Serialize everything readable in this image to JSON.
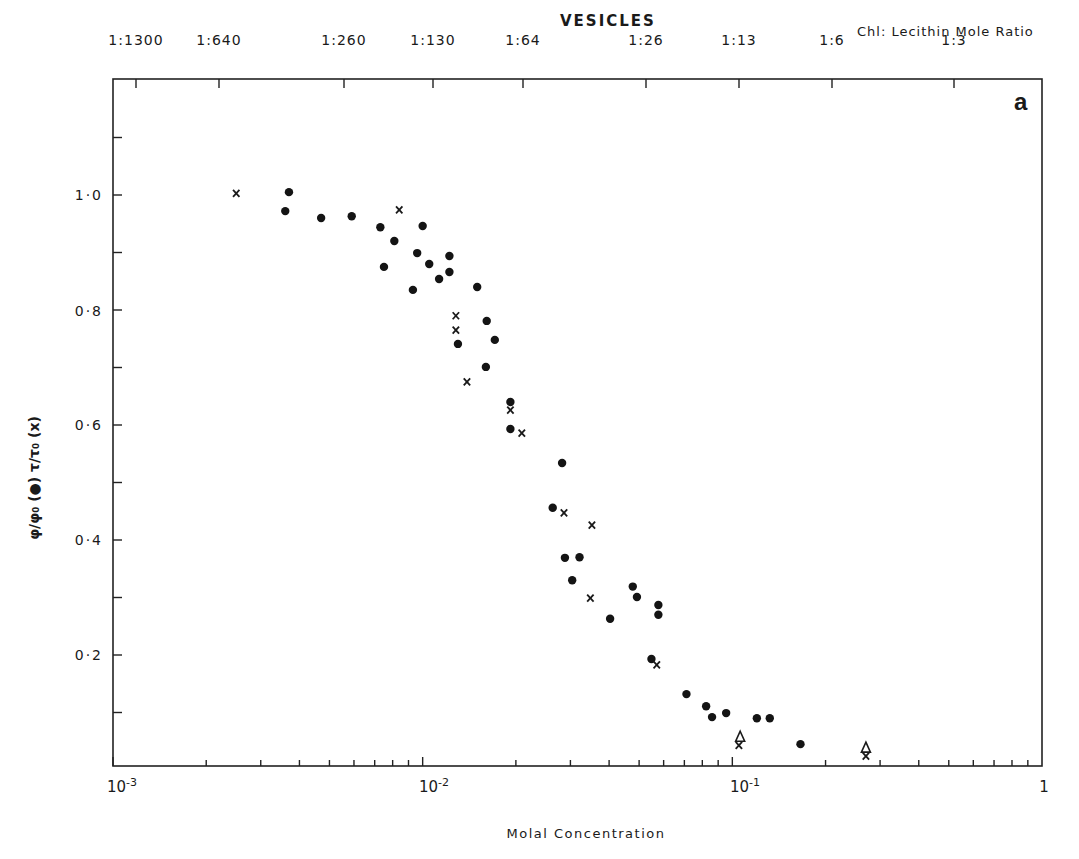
{
  "header": {
    "title": "VESICLES",
    "top_axis_label": "Chl: Lecithin Mole Ratio",
    "panel_letter": "a"
  },
  "axes": {
    "xlabel": "Molal Concentration",
    "ylabel": "φ/φ₀ (●)  τ/τ₀ (x)",
    "x_ticks": [
      {
        "label": "10",
        "exp": "-3"
      },
      {
        "label": "10",
        "exp": "-2"
      },
      {
        "label": "10",
        "exp": "-1"
      },
      {
        "label": "1",
        "exp": ""
      }
    ],
    "y_ticks": [
      "1·0",
      "0·8",
      "0·6",
      "0·4",
      "0·2"
    ],
    "top_ticks": [
      "1:1300",
      "1:640",
      "1:260",
      "1:130",
      "1:64",
      "1:26",
      "1:13",
      "1:6",
      "1:3"
    ]
  },
  "chart_data": {
    "type": "scatter",
    "title": "VESICLES",
    "xlabel": "Molal Concentration",
    "ylabel": "φ/φ₀ (●)  τ/τ₀ (x)",
    "xscale": "log",
    "xlim": [
      0.001,
      1
    ],
    "ylim": [
      0,
      1.2
    ],
    "grid": false,
    "secondary_x_axis": {
      "label": "Chl: Lecithin Mole Ratio",
      "ticks": [
        "1:1300",
        "1:640",
        "1:260",
        "1:130",
        "1:64",
        "1:26",
        "1:13",
        "1:6",
        "1:3"
      ]
    },
    "series": [
      {
        "name": "φ/φ₀ (filled circles)",
        "marker": "circle",
        "points": [
          [
            0.0037,
            1.005
          ],
          [
            0.0036,
            0.972
          ],
          [
            0.0047,
            0.96
          ],
          [
            0.0059,
            0.963
          ],
          [
            0.0073,
            0.944
          ],
          [
            0.0081,
            0.92
          ],
          [
            0.01,
            0.946
          ],
          [
            0.0096,
            0.899
          ],
          [
            0.0075,
            0.875
          ],
          [
            0.0105,
            0.88
          ],
          [
            0.0122,
            0.894
          ],
          [
            0.0113,
            0.854
          ],
          [
            0.0122,
            0.866
          ],
          [
            0.0093,
            0.835
          ],
          [
            0.015,
            0.84
          ],
          [
            0.013,
            0.741
          ],
          [
            0.0161,
            0.781
          ],
          [
            0.0171,
            0.748
          ],
          [
            0.016,
            0.701
          ],
          [
            0.0192,
            0.64
          ],
          [
            0.0192,
            0.593
          ],
          [
            0.0282,
            0.534
          ],
          [
            0.0263,
            0.456
          ],
          [
            0.0288,
            0.369
          ],
          [
            0.0321,
            0.37
          ],
          [
            0.0304,
            0.33
          ],
          [
            0.0403,
            0.263
          ],
          [
            0.0477,
            0.319
          ],
          [
            0.0492,
            0.301
          ],
          [
            0.0577,
            0.287
          ],
          [
            0.0577,
            0.27
          ],
          [
            0.0548,
            0.193
          ],
          [
            0.0711,
            0.132
          ],
          [
            0.0823,
            0.111
          ],
          [
            0.086,
            0.092
          ],
          [
            0.0955,
            0.099
          ],
          [
            0.12,
            0.09
          ],
          [
            0.1321,
            0.09
          ],
          [
            0.166,
            0.045
          ]
        ]
      },
      {
        "name": "τ/τ₀ (crosses)",
        "marker": "x",
        "points": [
          [
            0.0025,
            1.003
          ],
          [
            0.0084,
            0.974
          ],
          [
            0.0128,
            0.79
          ],
          [
            0.0128,
            0.765
          ],
          [
            0.0139,
            0.675
          ],
          [
            0.0192,
            0.626
          ],
          [
            0.0209,
            0.586
          ],
          [
            0.0286,
            0.447
          ],
          [
            0.0352,
            0.426
          ],
          [
            0.0348,
            0.299
          ],
          [
            0.057,
            0.183
          ],
          [
            0.105,
            0.043
          ],
          [
            0.27,
            0.024
          ]
        ]
      },
      {
        "name": "triangles",
        "marker": "triangle",
        "points": [
          [
            0.106,
            0.057
          ],
          [
            0.27,
            0.038
          ]
        ]
      }
    ]
  }
}
